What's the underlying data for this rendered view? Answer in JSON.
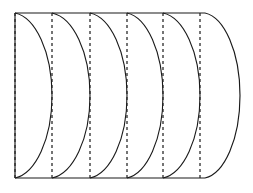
{
  "figure": {
    "background_color": "#ffffff",
    "stroke_color": "#1a1a1a",
    "dash_color": "#222222",
    "canvas": {
      "width": 253,
      "height": 193
    }
  },
  "geometry": {
    "body": {
      "left_x": 15,
      "right_x": 205,
      "top_y": 13,
      "bottom_y": 178,
      "height": 165
    },
    "cap": {
      "bulge_x": 240,
      "start_x": 205,
      "type": "right-rounded-end"
    },
    "arc_apex_offset": 37,
    "arc_count": 6,
    "dash_count": 6
  },
  "arcs": [
    {
      "name": "arc-1",
      "start_x": 15,
      "apex_x": 52
    },
    {
      "name": "arc-2",
      "start_x": 52,
      "apex_x": 90
    },
    {
      "name": "arc-3",
      "start_x": 90,
      "apex_x": 127
    },
    {
      "name": "arc-4",
      "start_x": 127,
      "apex_x": 163
    },
    {
      "name": "arc-5",
      "start_x": 163,
      "apex_x": 200
    },
    {
      "name": "arc-6",
      "start_x": 200,
      "apex_x": 240
    }
  ],
  "dashed_lines": [
    {
      "name": "chord-1",
      "x": 15
    },
    {
      "name": "chord-2",
      "x": 52
    },
    {
      "name": "chord-3",
      "x": 90
    },
    {
      "name": "chord-4",
      "x": 127
    },
    {
      "name": "chord-5",
      "x": 163
    },
    {
      "name": "chord-6",
      "x": 200
    }
  ]
}
